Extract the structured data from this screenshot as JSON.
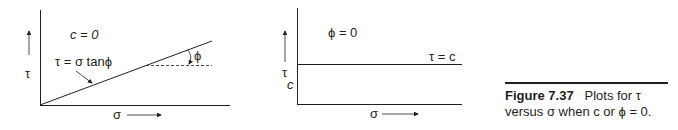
{
  "figure": {
    "number": "Figure 7.37",
    "caption": "Plots for τ versus σ when c or ϕ = 0.",
    "caption_line1_rest": "Plots for τ",
    "caption_line2": "versus σ when c or ϕ = 0."
  },
  "left_plot": {
    "condition": "c = 0",
    "equation": "τ = σ tanϕ",
    "angle_label": "ϕ",
    "y_axis_label": "τ",
    "x_axis_label": "σ"
  },
  "right_plot": {
    "condition": "ϕ = 0",
    "line_label": "τ = c",
    "intercept_label": "c",
    "y_axis_label": "τ",
    "x_axis_label": "σ"
  },
  "colors": {
    "ink": "#231f20"
  }
}
